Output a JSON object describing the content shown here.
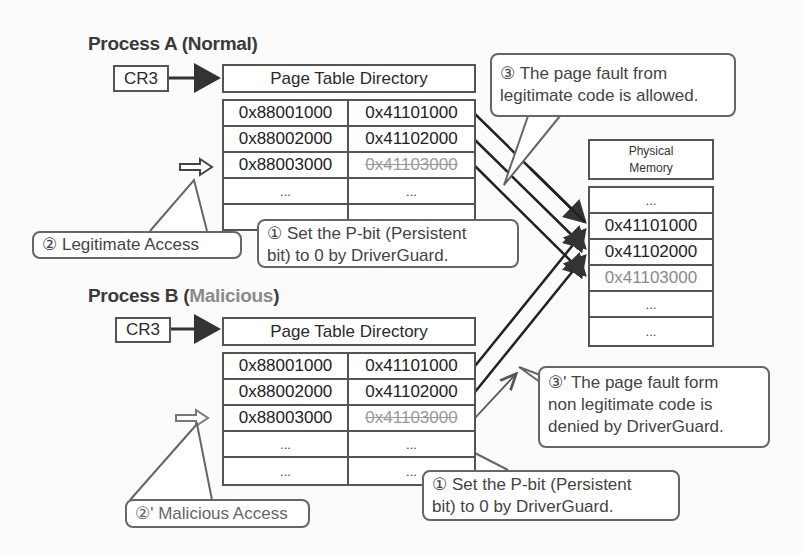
{
  "process_a": {
    "title": "Process A (Normal)",
    "title_prefix": "Process A (",
    "title_kind": "Normal",
    "title_suffix": ")",
    "cr3_label": "CR3",
    "ptd_label": "Page Table Directory",
    "rows": [
      {
        "virtual": "0x88001000",
        "physical": "0x41101000",
        "struck": false
      },
      {
        "virtual": "0x88002000",
        "physical": "0x41102000",
        "struck": false
      },
      {
        "virtual": "0x88003000",
        "physical": "0x41103000",
        "struck": true
      },
      {
        "virtual": "...",
        "physical": "...",
        "struck": false
      },
      {
        "virtual": "",
        "physical": "",
        "struck": false
      }
    ],
    "access_callout": "② Legitimate Access",
    "pbit_callout_line1": "① Set the P-bit (Persistent",
    "pbit_callout_line2": "bit) to 0 by DriverGuard.",
    "fault_callout_line1": "③ The page fault from",
    "fault_callout_line2": "legitimate code is allowed."
  },
  "process_b": {
    "title_prefix": "Process B (",
    "title_kind": "Malicious",
    "title_suffix": ")",
    "cr3_label": "CR3",
    "ptd_label": "Page Table Directory",
    "rows": [
      {
        "virtual": "0x88001000",
        "physical": "0x41101000",
        "struck": false
      },
      {
        "virtual": "0x88002000",
        "physical": "0x41102000",
        "struck": false
      },
      {
        "virtual": "0x88003000",
        "physical": "0x41103000",
        "struck": true
      },
      {
        "virtual": "...",
        "physical": "...",
        "struck": false
      },
      {
        "virtual": "...",
        "physical": "...",
        "struck": false
      }
    ],
    "access_callout": "②' Malicious Access",
    "pbit_callout_line1": "① Set the P-bit (Persistent",
    "pbit_callout_line2": "bit) to 0 by DriverGuard.",
    "fault_callout_line1": "③' The page fault form",
    "fault_callout_line2": "non legitimate code is",
    "fault_callout_line3": "denied by DriverGuard."
  },
  "physical_memory": {
    "header_line1": "Physical",
    "header_line2": "Memory",
    "rows": [
      {
        "value": "...",
        "faded": false
      },
      {
        "value": "0x41101000",
        "faded": false
      },
      {
        "value": "0x41102000",
        "faded": false
      },
      {
        "value": "0x41103000",
        "faded": true
      },
      {
        "value": "...",
        "faded": false
      },
      {
        "value": "...",
        "faded": false
      }
    ]
  },
  "colors": {
    "line": "#333333",
    "border": "#555555",
    "faded_text": "#8a8a8a",
    "background": "#fbfbfb"
  }
}
